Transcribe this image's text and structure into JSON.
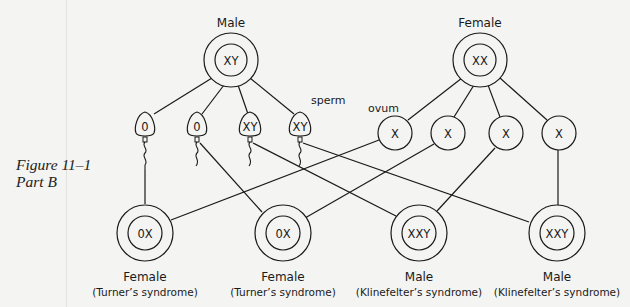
{
  "figure": {
    "caption_line1": "Figure 11–1",
    "caption_line2": "Part B"
  },
  "parents": {
    "male": {
      "label": "Male",
      "genotype": "XY"
    },
    "female": {
      "label": "Female",
      "genotype": "XX"
    }
  },
  "gametes": {
    "sperm_label": "sperm",
    "ovum_label": "ovum",
    "sperm": [
      {
        "genotype": "0"
      },
      {
        "genotype": "0"
      },
      {
        "genotype": "XY"
      },
      {
        "genotype": "XY"
      }
    ],
    "ova": [
      {
        "genotype": "X"
      },
      {
        "genotype": "X"
      },
      {
        "genotype": "X"
      },
      {
        "genotype": "X"
      }
    ]
  },
  "offspring": [
    {
      "genotype": "0X",
      "sex": "Female",
      "condition": "(Turner’s syndrome)"
    },
    {
      "genotype": "0X",
      "sex": "Female",
      "condition": "(Turner’s syndrome)"
    },
    {
      "genotype": "XXY",
      "sex": "Male",
      "condition": "(Klinefelter’s syndrome)"
    },
    {
      "genotype": "XXY",
      "sex": "Male",
      "condition": "(Klinefelter’s syndrome)"
    }
  ],
  "crosses": [
    {
      "sperm": 0,
      "ovum": 0,
      "offspring": 0
    },
    {
      "sperm": 1,
      "ovum": 1,
      "offspring": 1
    },
    {
      "sperm": 2,
      "ovum": 2,
      "offspring": 2
    },
    {
      "sperm": 3,
      "ovum": 3,
      "offspring": 3
    }
  ]
}
